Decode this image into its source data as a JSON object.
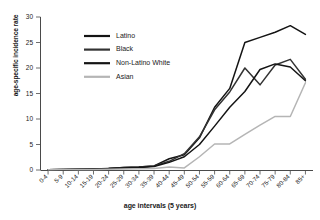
{
  "chart_data": {
    "type": "line",
    "title": "",
    "xlabel": "age intervals (5 years)",
    "ylabel": "age-specific incidence rate",
    "ylim": [
      0,
      30
    ],
    "yticks": [
      0,
      5,
      10,
      15,
      20,
      25,
      30
    ],
    "grid": false,
    "legend_position": "upper-left-inside",
    "categories": [
      "0-4",
      "5-9",
      "10-14",
      "15-19",
      "20-24",
      "25-29",
      "30-34",
      "35-39",
      "40-44",
      "45-49",
      "50-54",
      "55-59",
      "60-64",
      "65-69",
      "70-74",
      "75-79",
      "80-84",
      "85+"
    ],
    "series": [
      {
        "name": "Latino",
        "color": "#141414",
        "values": [
          0.05,
          0.1,
          0.15,
          0.2,
          0.3,
          0.5,
          0.6,
          0.8,
          2.2,
          3.0,
          6.3,
          12.3,
          16.0,
          25.0,
          26.0,
          27.0,
          28.3,
          26.6
        ]
      },
      {
        "name": "Black",
        "color": "#333333",
        "values": [
          0.05,
          0.1,
          0.15,
          0.2,
          0.3,
          0.5,
          0.6,
          0.8,
          1.7,
          3.2,
          6.5,
          11.8,
          15.3,
          20.0,
          16.7,
          20.6,
          21.7,
          17.8
        ]
      },
      {
        "name": "Non-Latino White",
        "color": "#141414",
        "values": [
          0.05,
          0.1,
          0.15,
          0.2,
          0.3,
          0.4,
          0.5,
          0.7,
          1.5,
          2.6,
          5.0,
          8.6,
          12.3,
          15.4,
          19.7,
          20.8,
          20.2,
          17.5
        ]
      },
      {
        "name": "Asian",
        "color": "#b5b5b5",
        "values": [
          0.05,
          0.08,
          0.1,
          0.12,
          0.15,
          0.2,
          0.25,
          0.3,
          0.6,
          0.4,
          2.6,
          5.1,
          5.1,
          7.0,
          8.8,
          10.5,
          10.5,
          17.1
        ]
      }
    ]
  }
}
